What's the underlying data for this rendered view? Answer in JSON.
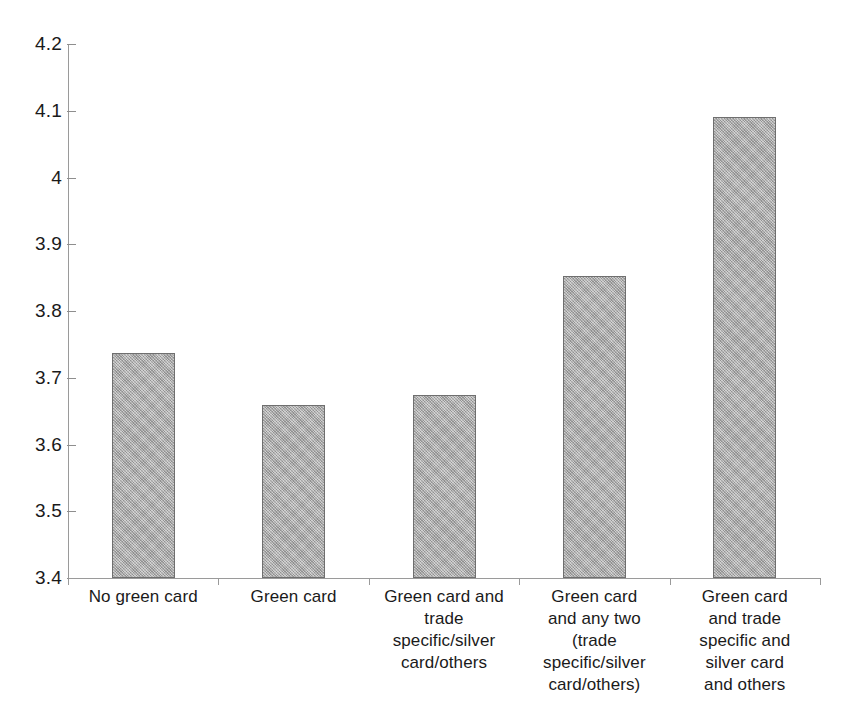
{
  "chart_data": {
    "type": "bar",
    "title": "",
    "subtitle": "",
    "xlabel": "",
    "ylabel": "",
    "ylim": [
      3.4,
      4.2
    ],
    "ytick_step": 0.1,
    "yticks": [
      "4.2",
      "4.1",
      "4",
      "3.9",
      "3.8",
      "3.7",
      "3.6",
      "3.5",
      "3.4"
    ],
    "ytick_values": [
      4.2,
      4.1,
      4.0,
      3.9,
      3.8,
      3.7,
      3.6,
      3.5,
      3.4
    ],
    "grid": false,
    "legend": false,
    "legend_position": "none",
    "categories": [
      "No green card",
      "Green card",
      "Green card and\ntrade\nspecific/silver\ncard/others",
      "Green card\nand any two\n(trade specific/silver\ncard/others)",
      "Green card\nand trade\nspecific and\nsilver card\nand others"
    ],
    "values": [
      3.737,
      3.659,
      3.674,
      3.853,
      4.09
    ],
    "annotations": []
  },
  "style": {
    "bar_fill": "#a8a8a8",
    "bar_border": "#6f6f6f",
    "axis_color": "#9a9a9a",
    "text_color": "#1a1a1a",
    "background": "#ffffff"
  }
}
